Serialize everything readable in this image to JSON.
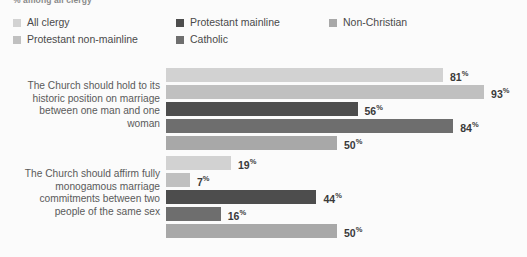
{
  "subtitle": "% among all clergy",
  "legend": {
    "items": [
      {
        "label": "All clergy",
        "color": "#d2d2d2",
        "swatch_name": "legend-swatch-all-clergy"
      },
      {
        "label": "Protestant mainline",
        "color": "#4d4d4d",
        "swatch_name": "legend-swatch-protestant-mainline"
      },
      {
        "label": "Non-Christian",
        "color": "#a8a8a8",
        "swatch_name": "legend-swatch-non-christian"
      },
      {
        "label": "Protestant non-mainline",
        "color": "#c0c0c0",
        "swatch_name": "legend-swatch-protestant-non-mainline"
      },
      {
        "label": "Catholic",
        "color": "#6e6e6e",
        "swatch_name": "legend-swatch-catholic"
      }
    ]
  },
  "chart_data": {
    "type": "bar",
    "orientation": "horizontal",
    "title": "",
    "subtitle": "% among all clergy",
    "xlabel": "",
    "ylabel": "",
    "xlim": [
      0,
      100
    ],
    "grid": false,
    "legend_position": "top",
    "value_suffix": "%",
    "categories": [
      "The Church should hold to its historic position on marriage between one man and one woman",
      "The Church should affirm fully monogamous marriage commitments between two people of the same sex"
    ],
    "series": [
      {
        "name": "All clergy",
        "color": "#d2d2d2",
        "values": [
          81,
          19
        ]
      },
      {
        "name": "Protestant non-mainline",
        "color": "#c0c0c0",
        "values": [
          93,
          7
        ]
      },
      {
        "name": "Protestant mainline",
        "color": "#4d4d4d",
        "values": [
          56,
          44
        ]
      },
      {
        "name": "Catholic",
        "color": "#6e6e6e",
        "values": [
          84,
          16
        ]
      },
      {
        "name": "Non-Christian",
        "color": "#a8a8a8",
        "values": [
          50,
          50
        ]
      }
    ]
  }
}
